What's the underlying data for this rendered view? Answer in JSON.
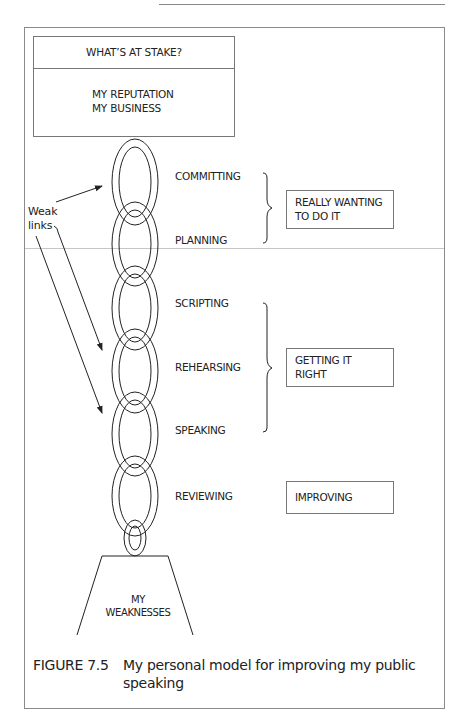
{
  "stake_box": {
    "title": "WHAT’S AT STAKE?",
    "lines": [
      "MY REPUTATION",
      "MY BUSINESS"
    ]
  },
  "weak_links_label": [
    "Weak",
    "links"
  ],
  "stages": [
    {
      "label": "COMMITTING"
    },
    {
      "label": "PLANNING"
    },
    {
      "label": "SCRIPTING"
    },
    {
      "label": "REHEARSING"
    },
    {
      "label": "SPEAKING"
    },
    {
      "label": "REVIEWING"
    }
  ],
  "groups": [
    {
      "lines": [
        "REALLY WANTING",
        "TO DO IT"
      ],
      "stages": [
        "COMMITTING",
        "PLANNING"
      ]
    },
    {
      "lines": [
        "GETTING IT",
        "RIGHT"
      ],
      "stages": [
        "SCRIPTING",
        "REHEARSING",
        "SPEAKING"
      ]
    },
    {
      "lines": [
        "IMPROVING"
      ],
      "stages": [
        "REVIEWING"
      ]
    }
  ],
  "pedestal": {
    "lines": [
      "MY",
      "WEAKNESSES"
    ]
  },
  "caption": {
    "number": "FIGURE 7.5",
    "text": "My personal model for improving my public speaking"
  },
  "colors": {
    "ink": "#222222",
    "frame": "#8a8a8a",
    "background": "#ffffff"
  }
}
